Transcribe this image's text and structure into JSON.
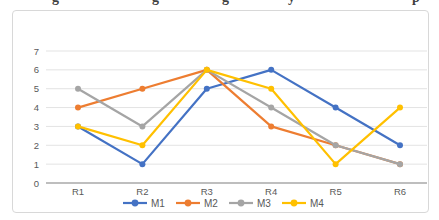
{
  "page": {
    "top_text_fragments": [
      {
        "glyph": "g",
        "x": 52
      },
      {
        "glyph": "g",
        "x": 152
      },
      {
        "glyph": "g",
        "x": 222
      },
      {
        "glyph": "y",
        "x": 288
      },
      {
        "glyph": "p",
        "x": 412
      }
    ]
  },
  "chart_data": {
    "type": "line",
    "title": "",
    "xlabel": "",
    "ylabel": "",
    "categories": [
      "R1",
      "R2",
      "R3",
      "R4",
      "R5",
      "R6"
    ],
    "series": [
      {
        "name": "M1",
        "color": "#4472C4",
        "values": [
          3,
          1,
          5,
          6,
          4,
          2
        ]
      },
      {
        "name": "M2",
        "color": "#ED7D31",
        "values": [
          4,
          5,
          6,
          3,
          2,
          1
        ]
      },
      {
        "name": "M3",
        "color": "#A5A5A5",
        "values": [
          5,
          3,
          6,
          4,
          2,
          1
        ]
      },
      {
        "name": "M4",
        "color": "#FFC000",
        "values": [
          3,
          2,
          6,
          5,
          1,
          4
        ]
      }
    ],
    "ylim": [
      0,
      7
    ],
    "yticks": [
      0,
      1,
      2,
      3,
      4,
      5,
      6,
      7
    ],
    "grid": true,
    "marker": "circle",
    "legend_position": "bottom",
    "legend_labels": [
      "M1",
      "M2",
      "M3",
      "M4"
    ],
    "colors": {
      "gridline": "#e3e3e3",
      "axis_line": "#a8a8a8",
      "tick_text": "#595959",
      "frame_border": "#d8d8d8",
      "background": "#ffffff"
    }
  }
}
